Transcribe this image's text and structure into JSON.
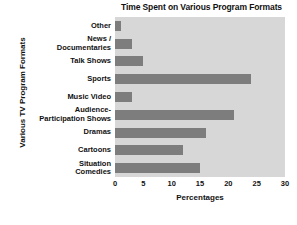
{
  "chart_data": {
    "type": "bar",
    "orientation": "horizontal",
    "title": "Time Spent on Various Program Formats",
    "xlabel": "Percentages",
    "ylabel": "Various TV Program Formats",
    "categories": [
      "Other",
      "News /\nDocumentaries",
      "Talk Shows",
      "Sports",
      "Music Video",
      "Audience-\nParticipation Shows",
      "Dramas",
      "Cartoons",
      "Situation\nComedies"
    ],
    "category_lines": [
      [
        "Other"
      ],
      [
        "News /",
        "Documentaries"
      ],
      [
        "Talk Shows"
      ],
      [
        "Sports"
      ],
      [
        "Music Video"
      ],
      [
        "Audience-",
        "Participation Shows"
      ],
      [
        "Dramas"
      ],
      [
        "Cartoons"
      ],
      [
        "Situation",
        "Comedies"
      ]
    ],
    "values": [
      1,
      3,
      5,
      24,
      3,
      21,
      16,
      12,
      15
    ],
    "xlim": [
      0,
      30
    ],
    "xticks": [
      0,
      5,
      10,
      15,
      20,
      25,
      30
    ],
    "xtick_labels": [
      "0",
      "5",
      "10",
      "15",
      "20",
      "25",
      "30"
    ],
    "grid": false,
    "legend": null,
    "bar_color": "#7d7d7d",
    "plot_background": "#d7d7d7",
    "figure_background": "#ffffff",
    "text_color": "#111111"
  }
}
